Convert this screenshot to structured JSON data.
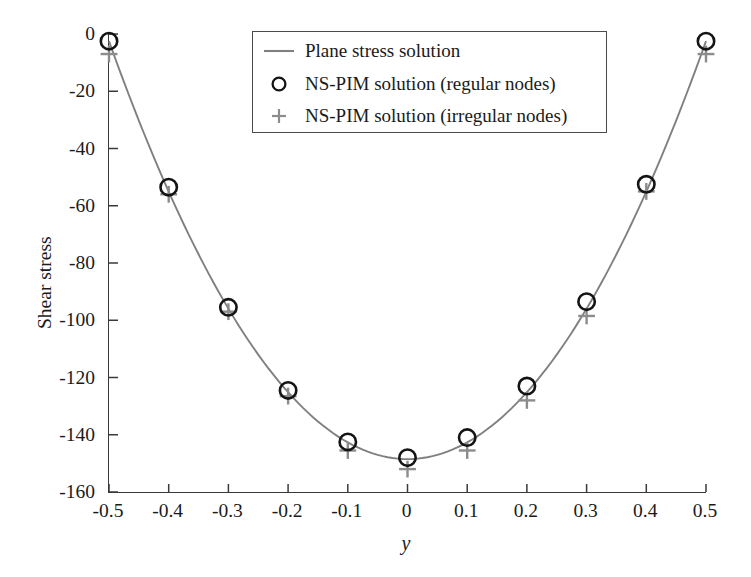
{
  "chart_data": {
    "type": "line",
    "title": "",
    "xlabel": "y",
    "ylabel": "Shear stress",
    "xlim": [
      -0.5,
      0.5
    ],
    "ylim": [
      -160,
      0
    ],
    "grid": false,
    "legend_position": "upper center",
    "xticks": [
      "-0.5",
      "-0.4",
      "-0.3",
      "-0.2",
      "-0.1",
      "0",
      "0.1",
      "0.2",
      "0.3",
      "0.4",
      "0.5"
    ],
    "xtick_values": [
      -0.5,
      -0.4,
      -0.3,
      -0.2,
      -0.1,
      0,
      0.1,
      0.2,
      0.3,
      0.4,
      0.5
    ],
    "yticks": [
      "0",
      "-20",
      "-40",
      "-60",
      "-80",
      "-100",
      "-120",
      "-140",
      "-160"
    ],
    "ytick_values": [
      0,
      -20,
      -40,
      -60,
      -80,
      -100,
      -120,
      -140,
      -160
    ],
    "series": [
      {
        "name": "Plane stress solution",
        "kind": "line",
        "color": "#808080",
        "x": [
          -0.5,
          -0.475,
          -0.45,
          -0.425,
          -0.4,
          -0.375,
          -0.35,
          -0.325,
          -0.3,
          -0.275,
          -0.25,
          -0.225,
          -0.2,
          -0.175,
          -0.15,
          -0.125,
          -0.1,
          -0.075,
          -0.05,
          -0.025,
          0,
          0.025,
          0.05,
          0.075,
          0.1,
          0.125,
          0.15,
          0.175,
          0.2,
          0.225,
          0.25,
          0.275,
          0.3,
          0.325,
          0.35,
          0.375,
          0.4,
          0.425,
          0.45,
          0.475,
          0.5
        ],
        "values": [
          -2.0,
          -9.3,
          -16.3,
          -23.1,
          -29.5,
          -35.7,
          -41.6,
          -47.2,
          -52.5,
          -57.6,
          -62.4,
          -66.9,
          -71.1,
          -75.0,
          -78.7,
          -82.0,
          -85.1,
          -87.9,
          -90.4,
          -92.6,
          -94.5,
          -96.2,
          -97.5,
          -98.6,
          -99.4,
          -99.8,
          -100.0,
          -99.8,
          -99.4,
          -98.6,
          -97.5,
          -96.2,
          -94.5,
          -92.6,
          -90.4,
          -87.9,
          -85.1,
          -82.0,
          -78.7,
          -75.0,
          -71.1
        ]
      },
      {
        "name": "NS-PIM solution (regular nodes)",
        "kind": "marker",
        "marker": "circle",
        "color": "#141414",
        "x": [
          -0.5,
          -0.4,
          -0.3,
          -0.2,
          -0.1,
          0,
          0.1,
          0.2,
          0.3,
          0.4,
          0.5
        ],
        "values": [
          -2.5,
          -53.5,
          -95.5,
          -124.5,
          -142.5,
          -148.0,
          -141.0,
          -123.0,
          -93.5,
          -52.5,
          -2.5
        ]
      },
      {
        "name": "NS-PIM solution (irregular nodes)",
        "kind": "marker",
        "marker": "plus",
        "color": "#8c8c8c",
        "x": [
          -0.5,
          -0.4,
          -0.3,
          -0.2,
          -0.1,
          0,
          0.1,
          0.2,
          0.3,
          0.4,
          0.5
        ],
        "values": [
          -7.0,
          -56.0,
          -97.0,
          -126.5,
          -145.5,
          -152.0,
          -145.5,
          -128.0,
          -98.5,
          -55.0,
          -7.0
        ]
      }
    ],
    "plane_stress_curve_note": "Parabola through (-0.5,-2.5) minimum (0,-148.5) and (0.5,-2.5)"
  },
  "legend": {
    "entries": [
      {
        "label": "Plane stress solution",
        "symbol": "line"
      },
      {
        "label": "NS-PIM solution (regular nodes)",
        "symbol": "circle"
      },
      {
        "label": "NS-PIM solution (irregular nodes)",
        "symbol": "plus"
      }
    ]
  },
  "colors": {
    "curve": "#808080",
    "circle": "#141414",
    "plus": "#8c8c8c",
    "axis": "#3a3a3a",
    "text": "#1a1a1a"
  }
}
